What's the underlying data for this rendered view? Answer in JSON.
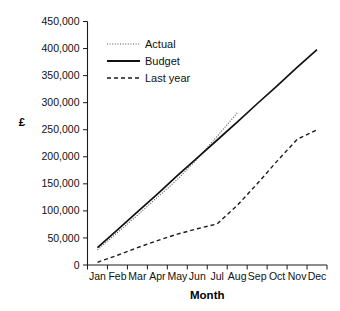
{
  "chart_data": {
    "type": "line",
    "title": "",
    "xlabel": "Month",
    "ylabel": "£",
    "categories": [
      "Jan",
      "Feb",
      "Mar",
      "Apr",
      "May",
      "Jun",
      "Jul",
      "Aug",
      "Sep",
      "Oct",
      "Nov",
      "Dec"
    ],
    "ylim": [
      0,
      450000
    ],
    "ytick_values": [
      0,
      50000,
      100000,
      150000,
      200000,
      250000,
      300000,
      350000,
      400000,
      450000
    ],
    "ytick_labels": [
      "0",
      "50,000",
      "100,000",
      "150,000",
      "200,000",
      "250,000",
      "300,000",
      "350,000",
      "400,000",
      "450,000"
    ],
    "grid": false,
    "legend_position": "top-left-inside",
    "series": [
      {
        "name": "Actual",
        "style": "dotted",
        "color": "#555555",
        "x": [
          "Jan",
          "Feb",
          "Mar",
          "Apr",
          "May",
          "Jun",
          "Jul",
          "Aug"
        ],
        "values": [
          28000,
          60000,
          92000,
          125000,
          158000,
          196000,
          238000,
          281000
        ]
      },
      {
        "name": "Budget",
        "style": "solid",
        "color": "#111111",
        "x": [
          "Jan",
          "Feb",
          "Mar",
          "Apr",
          "May",
          "Jun",
          "Jul",
          "Aug",
          "Sep",
          "Oct",
          "Nov",
          "Dec"
        ],
        "values": [
          32000,
          65000,
          98000,
          131000,
          165000,
          198000,
          231000,
          264000,
          298000,
          331000,
          365000,
          398000
        ]
      },
      {
        "name": "Last year",
        "style": "dashed",
        "color": "#1a1a1a",
        "x": [
          "Jan",
          "Feb",
          "Mar",
          "Apr",
          "May",
          "Jun",
          "Jul",
          "Aug",
          "Sep",
          "Oct",
          "Nov",
          "Dec"
        ],
        "values": [
          5000,
          18000,
          32000,
          45000,
          57000,
          67000,
          76000,
          110000,
          150000,
          192000,
          232000,
          250000
        ]
      }
    ]
  },
  "legend": {
    "entries": [
      {
        "label": "Actual"
      },
      {
        "label": "Budget"
      },
      {
        "label": "Last year"
      }
    ]
  },
  "axes": {
    "y_title": "£",
    "x_title": "Month"
  }
}
